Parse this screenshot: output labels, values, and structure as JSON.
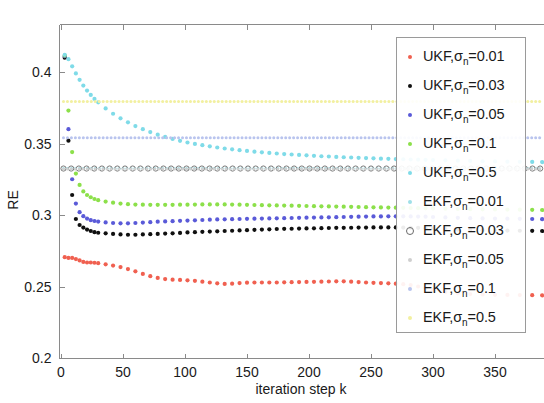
{
  "chart_data": {
    "type": "scatter",
    "title": "",
    "xlabel": "iteration step k",
    "ylabel": "RE",
    "xlim": [
      0,
      390
    ],
    "ylim": [
      0.2,
      0.42
    ],
    "xticks": [
      0,
      50,
      100,
      150,
      200,
      250,
      300,
      350
    ],
    "xticklabels": [
      "0",
      "50",
      "100",
      "150",
      "200",
      "250",
      "300",
      "350"
    ],
    "yticks": [
      0.2,
      0.25,
      0.3,
      0.35,
      0.4
    ],
    "yticklabels": [
      "0.2",
      "0.25",
      "0.3",
      "0.35",
      "0.4"
    ],
    "grid": false,
    "legend_position": "right",
    "marker": "dotted-points",
    "series": [
      {
        "name": "UKF, σn=0.01",
        "label_prefix": "UKF,",
        "label_sub": "n",
        "label_suffix": "=0.01",
        "color": "#f06050",
        "style": "dots",
        "x": [
          3,
          6,
          9,
          12,
          15,
          18,
          21,
          24,
          27,
          30,
          36,
          42,
          48,
          54,
          60,
          66,
          72,
          78,
          84,
          90,
          96,
          102,
          108,
          114,
          120,
          126,
          132,
          138,
          144,
          150,
          156,
          162,
          168,
          174,
          180,
          186,
          192,
          198,
          204,
          210,
          216,
          222,
          228,
          234,
          240,
          246,
          252,
          258,
          264,
          270,
          276,
          282,
          288,
          294,
          300,
          310,
          320,
          330,
          340,
          350,
          360,
          370,
          380,
          388
        ],
        "y": [
          0.2705,
          0.27,
          0.27,
          0.2692,
          0.2682,
          0.2672,
          0.2668,
          0.2668,
          0.2666,
          0.2663,
          0.2655,
          0.2646,
          0.2636,
          0.2622,
          0.2606,
          0.2588,
          0.2572,
          0.256,
          0.2552,
          0.2548,
          0.2546,
          0.2543,
          0.254,
          0.2534,
          0.2528,
          0.2522,
          0.2518,
          0.252,
          0.2524,
          0.2527,
          0.2528,
          0.2528,
          0.2528,
          0.2528,
          0.2529,
          0.253,
          0.2531,
          0.2532,
          0.2533,
          0.2534,
          0.2535,
          0.2536,
          0.2536,
          0.2534,
          0.2531,
          0.2528,
          0.2526,
          0.2524,
          0.2522,
          0.252,
          0.2516,
          0.251,
          0.25,
          0.2488,
          0.2476,
          0.2462,
          0.2452,
          0.2447,
          0.2444,
          0.2442,
          0.2441,
          0.244,
          0.2439,
          0.2438
        ]
      },
      {
        "name": "UKF, σn=0.03",
        "label_prefix": "UKF,",
        "label_sub": "n",
        "label_suffix": "=0.03",
        "color": "#101010",
        "style": "dots",
        "x": [
          3,
          6,
          9,
          12,
          15,
          18,
          21,
          24,
          27,
          30,
          36,
          42,
          48,
          54,
          60,
          66,
          72,
          78,
          84,
          90,
          96,
          102,
          108,
          114,
          120,
          126,
          132,
          138,
          144,
          150,
          156,
          162,
          168,
          174,
          180,
          186,
          192,
          198,
          204,
          210,
          216,
          222,
          228,
          234,
          240,
          246,
          252,
          258,
          264,
          270,
          276,
          282,
          288,
          294,
          300,
          310,
          320,
          330,
          340,
          350,
          360,
          370,
          380,
          388
        ],
        "y": [
          0.41,
          0.352,
          0.314,
          0.2972,
          0.293,
          0.2912,
          0.2898,
          0.2888,
          0.288,
          0.2876,
          0.2872,
          0.2868,
          0.2864,
          0.2862,
          0.2862,
          0.2864,
          0.2866,
          0.2868,
          0.287,
          0.2872,
          0.2875,
          0.2878,
          0.288,
          0.2882,
          0.2884,
          0.2886,
          0.2888,
          0.289,
          0.2892,
          0.2894,
          0.2896,
          0.2898,
          0.29,
          0.2902,
          0.2903,
          0.2904,
          0.2905,
          0.2906,
          0.2907,
          0.2908,
          0.2909,
          0.291,
          0.291,
          0.2911,
          0.2912,
          0.2912,
          0.2913,
          0.2913,
          0.2913,
          0.2913,
          0.2912,
          0.2911,
          0.291,
          0.2908,
          0.2906,
          0.2902,
          0.2898,
          0.2896,
          0.2894,
          0.2892,
          0.2891,
          0.289,
          0.2889,
          0.2888
        ]
      },
      {
        "name": "UKF, σn=0.05",
        "label_prefix": "UKF,",
        "label_sub": "n",
        "label_suffix": "=0.05",
        "color": "#5a5ad8",
        "style": "dots",
        "x": [
          3,
          6,
          9,
          12,
          15,
          18,
          21,
          24,
          27,
          30,
          36,
          42,
          48,
          54,
          60,
          66,
          72,
          78,
          84,
          90,
          96,
          102,
          108,
          114,
          120,
          126,
          132,
          138,
          144,
          150,
          156,
          162,
          168,
          174,
          180,
          186,
          192,
          198,
          204,
          210,
          216,
          222,
          228,
          234,
          240,
          246,
          252,
          258,
          264,
          270,
          276,
          282,
          288,
          294,
          300,
          310,
          320,
          330,
          340,
          350,
          360,
          370,
          380,
          388
        ],
        "y": [
          0.411,
          0.36,
          0.325,
          0.308,
          0.302,
          0.2992,
          0.2975,
          0.2964,
          0.2958,
          0.2954,
          0.2948,
          0.2944,
          0.2942,
          0.2942,
          0.2944,
          0.2947,
          0.295,
          0.2953,
          0.2955,
          0.2957,
          0.2959,
          0.2961,
          0.2963,
          0.2965,
          0.2967,
          0.2969,
          0.297,
          0.2971,
          0.2972,
          0.2973,
          0.2974,
          0.2975,
          0.2976,
          0.2977,
          0.2978,
          0.2979,
          0.298,
          0.2981,
          0.2982,
          0.2983,
          0.2984,
          0.2985,
          0.2986,
          0.2987,
          0.2988,
          0.2989,
          0.299,
          0.299,
          0.2991,
          0.2991,
          0.2991,
          0.299,
          0.2989,
          0.2988,
          0.2986,
          0.2983,
          0.298,
          0.2978,
          0.2976,
          0.2975,
          0.2974,
          0.2973,
          0.2972,
          0.2971
        ]
      },
      {
        "name": "UKF, σn=0.1",
        "label_prefix": "UKF,",
        "label_sub": "n",
        "label_suffix": "=0.1",
        "color": "#8ce04a",
        "style": "dots",
        "x": [
          3,
          6,
          9,
          12,
          15,
          18,
          21,
          24,
          27,
          30,
          36,
          42,
          48,
          54,
          60,
          66,
          72,
          78,
          84,
          90,
          96,
          102,
          108,
          114,
          120,
          126,
          132,
          138,
          144,
          150,
          156,
          162,
          168,
          174,
          180,
          186,
          192,
          198,
          204,
          210,
          216,
          222,
          228,
          234,
          240,
          246,
          252,
          258,
          264,
          270,
          276,
          282,
          288,
          294,
          300,
          310,
          320,
          330,
          340,
          350,
          360,
          370,
          380,
          388
        ],
        "y": [
          0.4115,
          0.373,
          0.344,
          0.329,
          0.321,
          0.3165,
          0.314,
          0.3124,
          0.3112,
          0.3104,
          0.3094,
          0.3086,
          0.308,
          0.3076,
          0.3073,
          0.3072,
          0.3071,
          0.3071,
          0.3071,
          0.3071,
          0.3072,
          0.3072,
          0.3073,
          0.3074,
          0.3074,
          0.3074,
          0.3074,
          0.3073,
          0.3072,
          0.3071,
          0.307,
          0.3069,
          0.3068,
          0.3067,
          0.3066,
          0.3065,
          0.3064,
          0.3063,
          0.3062,
          0.3061,
          0.306,
          0.3059,
          0.3058,
          0.3057,
          0.3056,
          0.3055,
          0.3054,
          0.3053,
          0.3052,
          0.3051,
          0.305,
          0.3049,
          0.3048,
          0.3047,
          0.3046,
          0.3044,
          0.3042,
          0.3041,
          0.304,
          0.3039,
          0.3038,
          0.3037,
          0.3036,
          0.3035
        ]
      },
      {
        "name": "UKF, σn=0.5",
        "label_prefix": "UKF,",
        "label_sub": "n",
        "label_suffix": "=0.5",
        "color": "#7fdbe8",
        "style": "dots",
        "x": [
          3,
          6,
          9,
          12,
          15,
          18,
          21,
          24,
          27,
          30,
          36,
          42,
          48,
          54,
          60,
          66,
          72,
          78,
          84,
          90,
          96,
          102,
          108,
          114,
          120,
          126,
          132,
          138,
          144,
          150,
          156,
          162,
          168,
          174,
          180,
          186,
          192,
          198,
          204,
          210,
          216,
          222,
          228,
          234,
          240,
          246,
          252,
          258,
          264,
          270,
          276,
          282,
          288,
          294,
          300,
          310,
          320,
          330,
          340,
          350,
          360,
          370,
          380,
          388
        ],
        "y": [
          0.412,
          0.409,
          0.404,
          0.399,
          0.3945,
          0.3905,
          0.387,
          0.384,
          0.3812,
          0.3788,
          0.3745,
          0.3708,
          0.3676,
          0.3648,
          0.3622,
          0.36,
          0.358,
          0.3562,
          0.3546,
          0.3532,
          0.3519,
          0.3507,
          0.3497,
          0.3488,
          0.348,
          0.3472,
          0.3465,
          0.3459,
          0.3453,
          0.3448,
          0.3443,
          0.3438,
          0.3434,
          0.343,
          0.3426,
          0.3423,
          0.342,
          0.3417,
          0.3414,
          0.3411,
          0.3409,
          0.3406,
          0.3404,
          0.3402,
          0.34,
          0.3398,
          0.3396,
          0.3394,
          0.3393,
          0.3391,
          0.339,
          0.3388,
          0.3387,
          0.3386,
          0.3384,
          0.3382,
          0.338,
          0.3378,
          0.3376,
          0.3375,
          0.3373,
          0.3372,
          0.3371,
          0.337
        ]
      },
      {
        "name": "EKF, σn=0.01",
        "label_prefix": "EKF,",
        "label_sub": "n",
        "label_suffix": "=0.01",
        "color": "#9fe0e8",
        "style": "flat-dash",
        "flat_value": 0.3325
      },
      {
        "name": "EKF, σn=0.03",
        "label_prefix": "EKF,",
        "label_sub": "n",
        "label_suffix": "=0.03",
        "color": "#6a6a6a",
        "style": "flat-hollow",
        "flat_value": 0.3325
      },
      {
        "name": "EKF, σn=0.05",
        "label_prefix": "EKF,",
        "label_sub": "n",
        "label_suffix": "=0.05",
        "color": "#cfcfcf",
        "style": "flat-dash",
        "flat_value": 0.3322
      },
      {
        "name": "EKF, σn=0.1",
        "label_prefix": "EKF,",
        "label_sub": "n",
        "label_suffix": "=0.1",
        "color": "#b9c4ee",
        "style": "flat-dash",
        "flat_value": 0.354
      },
      {
        "name": "EKF, σn=0.5",
        "label_prefix": "EKF,",
        "label_sub": "n",
        "label_suffix": "=0.5",
        "color": "#f2f0a0",
        "style": "flat-dash",
        "flat_value": 0.3793
      }
    ]
  },
  "axes": {
    "ylabel": "RE",
    "xlabel": "iteration step k"
  }
}
